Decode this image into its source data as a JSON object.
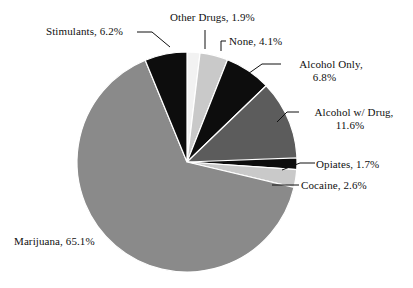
{
  "chart_data": {
    "type": "pie",
    "title": "",
    "subtitle": "",
    "xlabel": "",
    "ylabel": "",
    "legend_position": "none",
    "grid": false,
    "units": "percent",
    "categories": [
      "Marijuana",
      "Stimulants",
      "Other Drugs",
      "None",
      "Alcohol Only",
      "Alcohol w/ Drug",
      "Opiates",
      "Cocaine"
    ],
    "values": [
      65.1,
      6.2,
      1.9,
      4.1,
      6.8,
      11.6,
      1.7,
      2.6
    ],
    "colors": [
      "#8a8a8a",
      "#0d0d0d",
      "#f2f2f2",
      "#c9c9c9",
      "#0d0d0d",
      "#5c5c5c",
      "#0d0d0d",
      "#c9c9c9"
    ],
    "slices": [
      {
        "label": "Marijuana",
        "value": 65.1,
        "display": "Marijuana, 65.1%",
        "color": "#8a8a8a"
      },
      {
        "label": "Stimulants",
        "value": 6.2,
        "display": "Stimulants, 6.2%",
        "color": "#0d0d0d"
      },
      {
        "label": "Other Drugs",
        "value": 1.9,
        "display": "Other Drugs, 1.9%",
        "color": "#f2f2f2"
      },
      {
        "label": "None",
        "value": 4.1,
        "display": "None, 4.1%",
        "color": "#c9c9c9"
      },
      {
        "label": "Alcohol Only",
        "value": 6.8,
        "display": "Alcohol Only, 6.8%",
        "color": "#0d0d0d"
      },
      {
        "label": "Alcohol w/ Drug",
        "value": 11.6,
        "display": "Alcohol w/ Drug, 11.6%",
        "color": "#5c5c5c"
      },
      {
        "label": "Opiates",
        "value": 1.7,
        "display": "Opiates, 1.7%",
        "color": "#0d0d0d"
      },
      {
        "label": "Cocaine",
        "value": 2.6,
        "display": "Cocaine, 2.6%",
        "color": "#c9c9c9"
      }
    ]
  },
  "labels": {
    "stimulants": "Stimulants, 6.2%",
    "other_drugs": "Other Drugs, 1.9%",
    "none": "None, 4.1%",
    "alcohol_only_line1": "Alcohol Only,",
    "alcohol_only_line2": "6.8%",
    "alcohol_with_drug_line1": "Alcohol w/ Drug,",
    "alcohol_with_drug_line2": "11.6%",
    "opiates": "Opiates, 1.7%",
    "cocaine": "Cocaine, 2.6%",
    "marijuana": "Marijuana, 65.1%"
  },
  "style": {
    "background": "#ffffff",
    "text_color": "#101010",
    "leader_color": "#101010",
    "slice_outline": "#ffffff"
  }
}
